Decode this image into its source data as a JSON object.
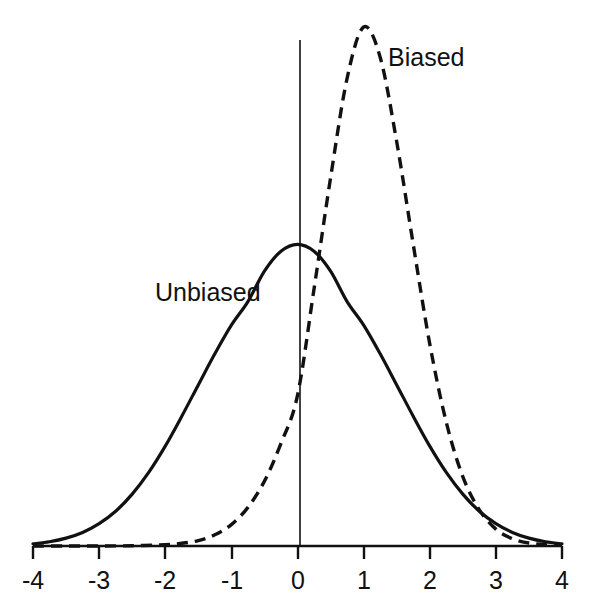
{
  "chart_data": {
    "type": "line",
    "title": "",
    "subtitle": "",
    "xlabel": "",
    "ylabel": "",
    "xlim": [
      -4,
      4
    ],
    "ylim": [
      0,
      1.75
    ],
    "grid": false,
    "legend_position": "inline-annotations",
    "x_ticks": [
      "-4",
      "-3",
      "-2",
      "-1",
      "0",
      "1",
      "2",
      "3",
      "4"
    ],
    "x_tick_values": [
      -4,
      -3,
      -2,
      -1,
      0,
      1,
      2,
      3,
      4
    ],
    "y_ticks": [],
    "annotations": [
      {
        "text": "Biased",
        "x": 1.35,
        "y": 1.6
      },
      {
        "text": "Unbiased",
        "x": -2.2,
        "y": 0.87
      }
    ],
    "series": [
      {
        "name": "Unbiased",
        "style": "solid",
        "color": "#111111",
        "distribution": "normal",
        "mean": 0,
        "mode": 0,
        "sigma": 1.15,
        "peak_value": 1.0,
        "x": [
          -4.0,
          -3.75,
          -3.5,
          -3.25,
          -3.0,
          -2.75,
          -2.5,
          -2.25,
          -2.0,
          -1.75,
          -1.5,
          -1.25,
          -1.0,
          -0.75,
          -0.5,
          -0.25,
          0.0,
          0.25,
          0.5,
          0.75,
          1.0,
          1.25,
          1.5,
          1.75,
          2.0,
          2.25,
          2.5,
          2.75,
          3.0,
          3.25,
          3.5,
          3.75,
          4.0
        ],
        "values": [
          0.007,
          0.014,
          0.026,
          0.045,
          0.074,
          0.115,
          0.172,
          0.244,
          0.331,
          0.43,
          0.534,
          0.637,
          0.732,
          0.81,
          0.911,
          0.977,
          1.0,
          0.977,
          0.911,
          0.81,
          0.732,
          0.637,
          0.534,
          0.43,
          0.331,
          0.244,
          0.172,
          0.115,
          0.074,
          0.045,
          0.026,
          0.014,
          0.007
        ]
      },
      {
        "name": "Biased",
        "style": "dashed",
        "color": "#111111",
        "distribution": "skewed-normal",
        "mode": 1.0,
        "sigma_left": 0.45,
        "sigma_right": 0.85,
        "peak_value": 1.72,
        "x": [
          -4.0,
          -3.5,
          -3.0,
          -2.5,
          -2.0,
          -1.75,
          -1.5,
          -1.25,
          -1.0,
          -0.75,
          -0.5,
          -0.25,
          0.0,
          0.25,
          0.5,
          0.75,
          1.0,
          1.25,
          1.5,
          1.75,
          2.0,
          2.25,
          2.5,
          2.75,
          3.0,
          3.25,
          3.5,
          3.75,
          4.0
        ],
        "values": [
          0.0,
          0.0,
          0.0,
          0.001,
          0.004,
          0.009,
          0.018,
          0.037,
          0.071,
          0.128,
          0.215,
          0.34,
          0.499,
          0.852,
          1.22,
          1.55,
          1.72,
          1.62,
          1.34,
          1.0,
          0.67,
          0.41,
          0.23,
          0.12,
          0.056,
          0.024,
          0.01,
          0.004,
          0.002
        ]
      }
    ]
  },
  "axis": {
    "x_axis_name": "x-axis-baseline",
    "y_axis_name": "y-axis-vertical-line"
  }
}
